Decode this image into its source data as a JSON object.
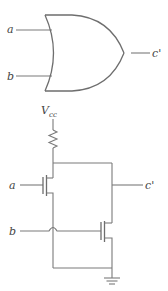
{
  "or_gate": {
    "inputs": [
      {
        "label": "a"
      },
      {
        "label": "b"
      }
    ],
    "output": {
      "label": "c'"
    }
  },
  "transistor_circuit": {
    "supply": {
      "label": "V",
      "subscript": "cc"
    },
    "inputs": [
      {
        "label": "a"
      },
      {
        "label": "b"
      }
    ],
    "output": {
      "label": "c'"
    },
    "components": [
      "resistor",
      "nmos-transistor-a",
      "nmos-transistor-b",
      "ground"
    ]
  }
}
